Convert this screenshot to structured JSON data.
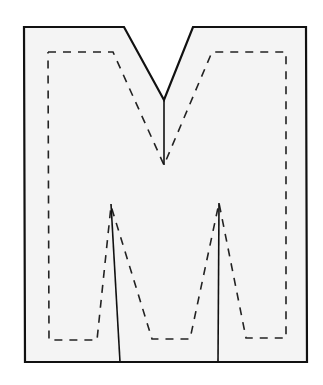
{
  "diagram": {
    "title": "Letter M cut-out template",
    "colors": {
      "background": "#ffffff",
      "fill": "#f4f4f4",
      "outline": "#111111",
      "dashed": "#222222",
      "cut_line": "#111111"
    },
    "outline_points": "24,27 124,27 164,100 193,27 306,27 307,362 25,362",
    "dashed_points": "48,52 113,52 164,165 212,52 286,52 286,338 246,338 219,203 190,339 152,339 111,206 97,340 49,340 48,52",
    "cut_lines": [
      {
        "x1": 164,
        "y1": 100,
        "x2": 164,
        "y2": 165
      },
      {
        "x1": 111,
        "y1": 204,
        "x2": 120,
        "y2": 362
      },
      {
        "x1": 219,
        "y1": 203,
        "x2": 218,
        "y2": 362
      }
    ]
  }
}
